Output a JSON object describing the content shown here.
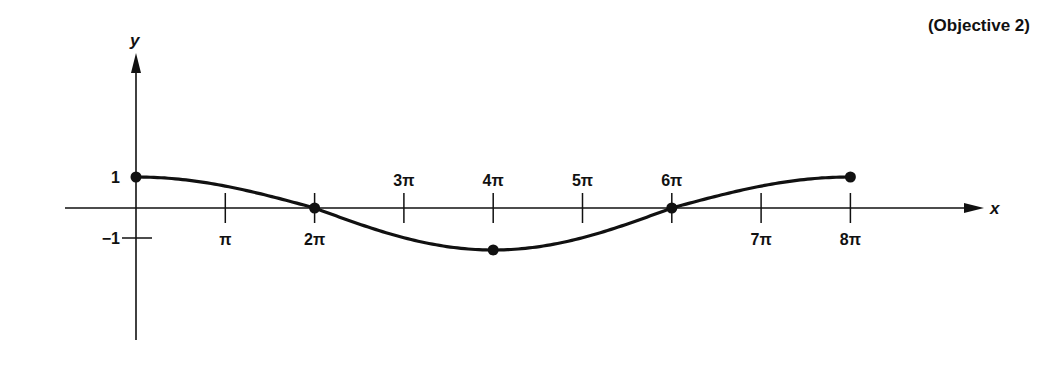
{
  "annotation": "(Objective 2)",
  "chart_data": {
    "type": "line",
    "title": "",
    "function": "y = cos(x/4)",
    "xlabel": "x",
    "ylabel": "y",
    "xlim": [
      0,
      8.8
    ],
    "ylim": [
      -1.5,
      1.5
    ],
    "grid": false,
    "x_tick_values_pi": [
      1,
      2,
      3,
      4,
      5,
      6,
      7,
      8
    ],
    "x_tick_labels": [
      "π",
      "2π",
      "3π",
      "4π",
      "5π",
      "6π",
      "7π",
      "8π"
    ],
    "x_tick_label_side": [
      "below",
      "below",
      "above",
      "above",
      "above",
      "above",
      "below",
      "below"
    ],
    "y_tick_values": [
      1,
      -1
    ],
    "y_tick_labels": [
      "1",
      "−1"
    ],
    "marked_points": [
      {
        "x": "0",
        "y": 1
      },
      {
        "x": "2π",
        "y": 0
      },
      {
        "x": "4π",
        "y": -1
      },
      {
        "x": "6π",
        "y": 0
      },
      {
        "x": "8π",
        "y": 1
      }
    ],
    "series": [
      {
        "name": "y = cos(x/4)",
        "x_pi": [
          0,
          0.5,
          1,
          1.5,
          2,
          2.5,
          3,
          3.5,
          4,
          4.5,
          5,
          5.5,
          6,
          6.5,
          7,
          7.5,
          8
        ],
        "values": [
          1,
          0.92,
          0.71,
          0.38,
          0,
          -0.38,
          -0.71,
          -0.92,
          -1,
          -0.92,
          -0.71,
          -0.38,
          0,
          0.38,
          0.71,
          0.92,
          1
        ]
      }
    ]
  }
}
